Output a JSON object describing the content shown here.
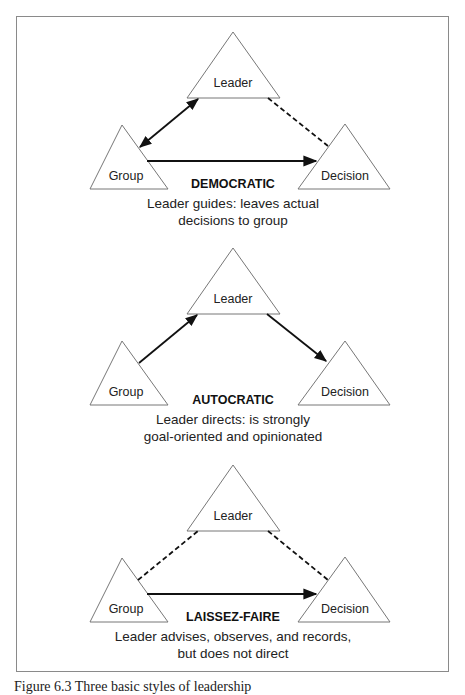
{
  "panels": [
    {
      "style": "DEMOCRATIC",
      "description_line1": "Leader guides: leaves actual",
      "description_line2": "decisions to group",
      "nodes": {
        "leader": "Leader",
        "group": "Group",
        "decision": "Decision"
      },
      "edges": [
        {
          "from": "Group",
          "to": "Leader",
          "type": "solid",
          "arrow": "both"
        },
        {
          "from": "Leader",
          "to": "Decision",
          "type": "dashed",
          "arrow": "none"
        },
        {
          "from": "Group",
          "to": "Decision",
          "type": "solid",
          "arrow": "end"
        }
      ]
    },
    {
      "style": "AUTOCRATIC",
      "description_line1": "Leader directs: is strongly",
      "description_line2": "goal-oriented and opinionated",
      "nodes": {
        "leader": "Leader",
        "group": "Group",
        "decision": "Decision"
      },
      "edges": [
        {
          "from": "Group",
          "to": "Leader",
          "type": "solid",
          "arrow": "end"
        },
        {
          "from": "Leader",
          "to": "Decision",
          "type": "solid",
          "arrow": "end"
        }
      ]
    },
    {
      "style": "LAISSEZ-FAIRE",
      "description_line1": "Leader advises, observes, and records,",
      "description_line2": "but does not direct",
      "nodes": {
        "leader": "Leader",
        "group": "Group",
        "decision": "Decision"
      },
      "edges": [
        {
          "from": "Group",
          "to": "Leader",
          "type": "dashed",
          "arrow": "none"
        },
        {
          "from": "Leader",
          "to": "Decision",
          "type": "dashed",
          "arrow": "none"
        },
        {
          "from": "Group",
          "to": "Decision",
          "type": "solid",
          "arrow": "end"
        }
      ]
    }
  ],
  "caption": "Figure 6.3   Three basic styles of leadership"
}
